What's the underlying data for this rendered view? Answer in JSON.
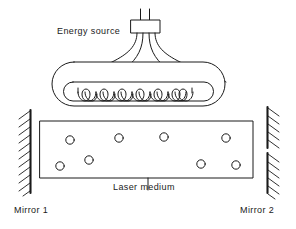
{
  "figure": {
    "stroke_color": "#1a1a1a",
    "fill_color": "#ffffff",
    "background": "#ffffff"
  },
  "labels": {
    "energy_source": "Energy source",
    "laser_medium": "Laser medium",
    "mirror_1": "Mirror 1",
    "mirror_2": "Mirror 2"
  },
  "components": {
    "energy_source_box": {
      "x": 131,
      "y": 20,
      "width": 29,
      "height": 13
    },
    "terminal_prongs": [
      {
        "x": 140,
        "y_top": 9,
        "y_bottom": 20
      },
      {
        "x": 149,
        "y_top": 9,
        "y_bottom": 20
      }
    ],
    "lead_wires_count": 4,
    "flashlamp_envelope": {
      "x": 52,
      "y": 62,
      "width": 173,
      "height": 44,
      "radius": 22
    },
    "flashlamp_inner_tube": {
      "x": 64,
      "y": 82,
      "width": 149,
      "height": 19,
      "radius": 9
    },
    "helix_turns": 10,
    "medium_rect": {
      "x": 40,
      "y": 121,
      "width": 213,
      "height": 57
    },
    "atoms": [
      {
        "cx": 70,
        "cy": 140,
        "r": 4.2
      },
      {
        "cx": 119,
        "cy": 138,
        "r": 4.2
      },
      {
        "cx": 164,
        "cy": 137,
        "r": 4.2
      },
      {
        "cx": 226,
        "cy": 138,
        "r": 4.2
      },
      {
        "cx": 89,
        "cy": 160,
        "r": 4.2
      },
      {
        "cx": 60,
        "cy": 166,
        "r": 4.2
      },
      {
        "cx": 201,
        "cy": 164,
        "r": 4.2
      },
      {
        "cx": 236,
        "cy": 165,
        "r": 4.2
      }
    ],
    "mirror_1": {
      "x": 30,
      "y_top": 110,
      "y_bottom": 193,
      "hatch_count": 11,
      "hatch_side": "left",
      "segments": 1
    },
    "mirror_2": {
      "x": 267,
      "y_top": 107,
      "y_bottom": 193,
      "hatch_count": 11,
      "hatch_side": "right",
      "segments": 2,
      "gap_top": 148,
      "gap_bottom": 153
    },
    "leader_line": {
      "x": 148,
      "y_top": 178,
      "y_bottom": 190
    }
  }
}
